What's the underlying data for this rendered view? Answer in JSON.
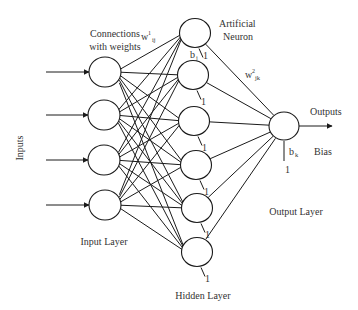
{
  "diagram": {
    "type": "feedforward-neural-network",
    "labels": {
      "inputs": "Inputs",
      "connections_line1": "Connections",
      "connections_line2": "with weights",
      "weight1_base": "w",
      "weight1_sup": "1",
      "weight1_sub": "ij",
      "neuron_line1": "Artificial",
      "neuron_line2": "Neuron",
      "bias_hidden_base": "b",
      "bias_hidden_sub": "j",
      "weight2_base": "w",
      "weight2_sup": "2",
      "weight2_sub": "jk",
      "outputs": "Outputs",
      "bias_output_base": "b",
      "bias_output_sub": "k",
      "bias_word": "Bias",
      "input_layer": "Input Layer",
      "hidden_layer": "Hidden Layer",
      "output_layer": "Output Layer",
      "bias_one": "1"
    },
    "layers": [
      {
        "name": "input",
        "count": 4
      },
      {
        "name": "hidden",
        "count": 6
      },
      {
        "name": "output",
        "count": 1
      }
    ],
    "connectivity": "fully-connected",
    "colors": {
      "stroke": "#1a1a1a",
      "text": "#333333",
      "background": "#ffffff"
    }
  }
}
